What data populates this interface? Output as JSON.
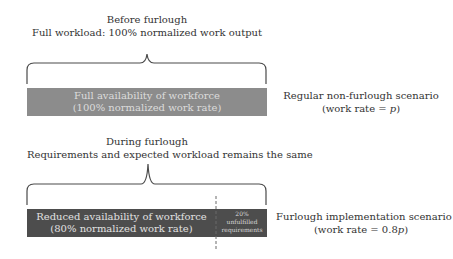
{
  "top": {
    "title_line1": "Before furlough",
    "title_line2": "Full workload: 100% normalized work output",
    "bar": {
      "label_line1": "Full availability of workforce",
      "label_line2": "(100% normalized work rate)",
      "color": "#8c8c8c",
      "text_color": "#dcdcdc"
    },
    "scenario_line1": "Regular non-furlough scenario",
    "scenario_line2_prefix": "(work rate = ",
    "scenario_line2_var": "p",
    "scenario_line2_suffix": ")"
  },
  "bottom": {
    "title_line1": "During furlough",
    "title_line2": "Requirements and expected workload remains the same",
    "bar": {
      "main_label_line1": "Reduced availability of workforce",
      "main_label_line2": "(80% normalized work rate)",
      "unfulfilled_line1": "20%",
      "unfulfilled_line2": "unfulfilled",
      "unfulfilled_line3": "requirements",
      "color": "#4d4d4d",
      "text_color": "#e2e2e2",
      "available_pct": 80,
      "unfulfilled_pct": 20
    },
    "scenario_line1": "Furlough implementation scenario",
    "scenario_line2_prefix": "(work rate = 0.8",
    "scenario_line2_var": "p",
    "scenario_line2_suffix": ")"
  }
}
